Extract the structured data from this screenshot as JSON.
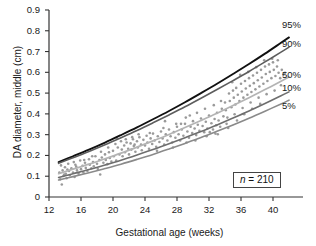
{
  "figure": {
    "background": "#ffffff",
    "axis_color": "#333333",
    "text_color": "#1a1a1a"
  },
  "axes": {
    "y_title": "DA diameter, middle (cm)",
    "x_title": "Gestational age (weeks)",
    "y_ticks": [
      "0.9",
      "0.8",
      "0.7",
      "0.6",
      "0.5",
      "0.4",
      "0.3",
      "0.2",
      "0.1",
      "0"
    ],
    "x_ticks": [
      "12",
      "16",
      "20",
      "24",
      "28",
      "32",
      "36",
      "40"
    ]
  },
  "annotation": {
    "n_symbol": "n",
    "n_equals": " = ",
    "n_value": "210"
  },
  "series_labels": {
    "p95": "95%",
    "p90": "90%",
    "p50": "50%",
    "p10": "10%",
    "p5": "5%"
  },
  "chart_data": {
    "type": "line",
    "title": "",
    "subtitle": "",
    "xlabel": "Gestational age (weeks)",
    "ylabel": "DA diameter, middle (cm)",
    "xlim": [
      12,
      42.2
    ],
    "ylim": [
      0,
      0.9
    ],
    "xticks": [
      12,
      16,
      20,
      24,
      28,
      32,
      36,
      40
    ],
    "yticks": [
      0,
      0.1,
      0.2,
      0.3,
      0.4,
      0.5,
      0.6,
      0.7,
      0.8,
      0.9
    ],
    "grid": false,
    "legend": "right-end-of-curves",
    "sample_size": 210,
    "annotations": [
      {
        "text": "n = 210",
        "x": 38.5,
        "y": 0.065,
        "boxed": true
      }
    ],
    "x": [
      13.2,
      15,
      17,
      19,
      21,
      23,
      25,
      27,
      29,
      31,
      33,
      35,
      37,
      39,
      41,
      42
    ],
    "series": [
      {
        "name": "95%",
        "color": "#111111",
        "width": 1.9,
        "values": [
          0.168,
          0.196,
          0.228,
          0.262,
          0.298,
          0.335,
          0.374,
          0.414,
          0.456,
          0.5,
          0.545,
          0.592,
          0.64,
          0.69,
          0.742,
          0.768
        ]
      },
      {
        "name": "90%",
        "color": "#5d5d5d",
        "width": 1.6,
        "values": [
          0.162,
          0.189,
          0.219,
          0.251,
          0.285,
          0.32,
          0.357,
          0.395,
          0.434,
          0.475,
          0.517,
          0.56,
          0.604,
          0.65,
          0.697,
          0.721
        ]
      },
      {
        "name": "50%",
        "color": "#b4b4b4",
        "width": 1.7,
        "values": [
          0.112,
          0.134,
          0.158,
          0.184,
          0.211,
          0.24,
          0.27,
          0.301,
          0.334,
          0.368,
          0.403,
          0.44,
          0.478,
          0.517,
          0.557,
          0.578
        ]
      },
      {
        "name": "10%",
        "color": "#6e6e6e",
        "width": 1.6,
        "values": [
          0.094,
          0.112,
          0.132,
          0.154,
          0.177,
          0.202,
          0.228,
          0.256,
          0.285,
          0.315,
          0.347,
          0.38,
          0.414,
          0.45,
          0.487,
          0.506
        ]
      },
      {
        "name": "5%",
        "color": "#8a8a8a",
        "width": 1.6,
        "values": [
          0.082,
          0.098,
          0.117,
          0.137,
          0.158,
          0.181,
          0.205,
          0.231,
          0.258,
          0.286,
          0.316,
          0.347,
          0.379,
          0.413,
          0.448,
          0.466
        ]
      }
    ],
    "scatter": {
      "name": "observations",
      "color": "#9a9a9a",
      "marker": "dot",
      "size": 1.3,
      "n": 210,
      "points": [
        [
          13.3,
          0.118
        ],
        [
          13.4,
          0.085
        ],
        [
          13.5,
          0.152
        ],
        [
          13.6,
          0.06
        ],
        [
          13.7,
          0.128
        ],
        [
          13.8,
          0.101
        ],
        [
          14.0,
          0.143
        ],
        [
          14.1,
          0.112
        ],
        [
          14.2,
          0.09
        ],
        [
          14.4,
          0.16
        ],
        [
          14.5,
          0.125
        ],
        [
          14.6,
          0.105
        ],
        [
          14.8,
          0.138
        ],
        [
          15.0,
          0.118
        ],
        [
          15.1,
          0.168
        ],
        [
          15.2,
          0.096
        ],
        [
          15.4,
          0.146
        ],
        [
          15.5,
          0.128
        ],
        [
          15.7,
          0.112
        ],
        [
          15.9,
          0.176
        ],
        [
          16.0,
          0.134
        ],
        [
          16.2,
          0.15
        ],
        [
          16.3,
          0.118
        ],
        [
          16.5,
          0.165
        ],
        [
          16.6,
          0.14
        ],
        [
          16.8,
          0.125
        ],
        [
          17.0,
          0.182
        ],
        [
          17.1,
          0.155
        ],
        [
          17.3,
          0.138
        ],
        [
          17.5,
          0.168
        ],
        [
          17.6,
          0.148
        ],
        [
          17.8,
          0.196
        ],
        [
          18.0,
          0.16
        ],
        [
          18.1,
          0.135
        ],
        [
          18.3,
          0.178
        ],
        [
          18.4,
          0.108
        ],
        [
          18.6,
          0.19
        ],
        [
          18.8,
          0.165
        ],
        [
          19.0,
          0.205
        ],
        [
          19.1,
          0.178
        ],
        [
          19.3,
          0.158
        ],
        [
          19.5,
          0.215
        ],
        [
          19.6,
          0.188
        ],
        [
          19.8,
          0.17
        ],
        [
          20.0,
          0.222
        ],
        [
          20.1,
          0.196
        ],
        [
          20.3,
          0.255
        ],
        [
          20.4,
          0.175
        ],
        [
          20.6,
          0.238
        ],
        [
          20.8,
          0.205
        ],
        [
          21.0,
          0.268
        ],
        [
          21.1,
          0.228
        ],
        [
          21.2,
          0.196
        ],
        [
          21.4,
          0.248
        ],
        [
          21.5,
          0.215
        ],
        [
          21.7,
          0.262
        ],
        [
          21.9,
          0.232
        ],
        [
          22.0,
          0.205
        ],
        [
          22.2,
          0.258
        ],
        [
          22.3,
          0.228
        ],
        [
          22.5,
          0.278
        ],
        [
          22.6,
          0.245
        ],
        [
          22.8,
          0.218
        ],
        [
          23.0,
          0.268
        ],
        [
          23.1,
          0.238
        ],
        [
          23.3,
          0.288
        ],
        [
          23.5,
          0.252
        ],
        [
          23.6,
          0.225
        ],
        [
          23.8,
          0.275
        ],
        [
          24.0,
          0.248
        ],
        [
          24.2,
          0.295
        ],
        [
          24.3,
          0.262
        ],
        [
          24.5,
          0.232
        ],
        [
          24.7,
          0.282
        ],
        [
          24.9,
          0.255
        ],
        [
          25.0,
          0.305
        ],
        [
          25.2,
          0.272
        ],
        [
          25.4,
          0.242
        ],
        [
          25.6,
          0.292
        ],
        [
          25.8,
          0.265
        ],
        [
          26.0,
          0.315
        ],
        [
          26.2,
          0.282
        ],
        [
          26.4,
          0.252
        ],
        [
          26.6,
          0.302
        ],
        [
          26.8,
          0.272
        ],
        [
          27.0,
          0.325
        ],
        [
          27.2,
          0.292
        ],
        [
          27.4,
          0.262
        ],
        [
          27.6,
          0.312
        ],
        [
          27.8,
          0.285
        ],
        [
          28.0,
          0.338
        ],
        [
          28.2,
          0.302
        ],
        [
          28.4,
          0.272
        ],
        [
          28.6,
          0.325
        ],
        [
          28.8,
          0.295
        ],
        [
          29.0,
          0.352
        ],
        [
          29.1,
          0.382
        ],
        [
          29.3,
          0.315
        ],
        [
          29.5,
          0.285
        ],
        [
          29.7,
          0.338
        ],
        [
          29.9,
          0.308
        ],
        [
          30.0,
          0.365
        ],
        [
          30.2,
          0.33
        ],
        [
          30.4,
          0.298
        ],
        [
          30.6,
          0.348
        ],
        [
          30.8,
          0.318
        ],
        [
          31.0,
          0.378
        ],
        [
          31.2,
          0.342
        ],
        [
          31.4,
          0.312
        ],
        [
          31.6,
          0.362
        ],
        [
          31.8,
          0.33
        ],
        [
          32.0,
          0.392
        ],
        [
          32.1,
          0.312
        ],
        [
          32.3,
          0.355
        ],
        [
          32.5,
          0.325
        ],
        [
          32.7,
          0.375
        ],
        [
          32.9,
          0.345
        ],
        [
          33.0,
          0.405
        ],
        [
          33.2,
          0.368
        ],
        [
          33.4,
          0.338
        ],
        [
          33.6,
          0.425
        ],
        [
          33.8,
          0.388
        ],
        [
          34.0,
          0.455
        ],
        [
          34.1,
          0.418
        ],
        [
          34.3,
          0.382
        ],
        [
          34.5,
          0.498
        ],
        [
          34.6,
          0.462
        ],
        [
          34.8,
          0.432
        ],
        [
          35.0,
          0.512
        ],
        [
          35.1,
          0.478
        ],
        [
          35.3,
          0.445
        ],
        [
          35.4,
          0.525
        ],
        [
          35.6,
          0.492
        ],
        [
          35.8,
          0.462
        ],
        [
          36.0,
          0.545
        ],
        [
          36.1,
          0.508
        ],
        [
          36.3,
          0.478
        ],
        [
          36.5,
          0.558
        ],
        [
          36.6,
          0.522
        ],
        [
          36.8,
          0.492
        ],
        [
          37.0,
          0.572
        ],
        [
          37.1,
          0.535
        ],
        [
          37.3,
          0.505
        ],
        [
          37.5,
          0.585
        ],
        [
          37.6,
          0.548
        ],
        [
          37.8,
          0.518
        ],
        [
          38.0,
          0.598
        ],
        [
          38.1,
          0.562
        ],
        [
          38.3,
          0.532
        ],
        [
          38.5,
          0.612
        ],
        [
          38.6,
          0.575
        ],
        [
          38.8,
          0.545
        ],
        [
          39.0,
          0.628
        ],
        [
          39.1,
          0.592
        ],
        [
          39.3,
          0.558
        ],
        [
          39.5,
          0.638
        ],
        [
          39.6,
          0.602
        ],
        [
          39.8,
          0.572
        ],
        [
          40.0,
          0.648
        ],
        [
          40.1,
          0.612
        ],
        [
          40.3,
          0.582
        ],
        [
          40.5,
          0.628
        ],
        [
          40.7,
          0.598
        ],
        [
          40.9,
          0.572
        ],
        [
          41.1,
          0.612
        ],
        [
          41.3,
          0.588
        ],
        [
          34.2,
          0.352
        ],
        [
          35.2,
          0.398
        ],
        [
          36.2,
          0.428
        ],
        [
          37.2,
          0.455
        ],
        [
          38.2,
          0.478
        ],
        [
          39.2,
          0.495
        ],
        [
          40.2,
          0.512
        ],
        [
          41.0,
          0.538
        ],
        [
          33.1,
          0.302
        ],
        [
          34.4,
          0.332
        ],
        [
          35.5,
          0.368
        ],
        [
          36.4,
          0.398
        ],
        [
          37.4,
          0.425
        ],
        [
          38.4,
          0.448
        ],
        [
          28.5,
          0.352
        ],
        [
          29.6,
          0.392
        ],
        [
          30.5,
          0.405
        ],
        [
          31.5,
          0.425
        ],
        [
          32.6,
          0.442
        ],
        [
          26.3,
          0.332
        ],
        [
          24.6,
          0.308
        ],
        [
          23.2,
          0.302
        ],
        [
          22.4,
          0.288
        ],
        [
          21.6,
          0.278
        ],
        [
          20.5,
          0.282
        ],
        [
          19.4,
          0.238
        ],
        [
          18.5,
          0.218
        ],
        [
          17.4,
          0.196
        ],
        [
          16.4,
          0.178
        ],
        [
          15.3,
          0.155
        ],
        [
          14.3,
          0.132
        ],
        [
          13.9,
          0.108
        ],
        [
          30.3,
          0.272
        ],
        [
          31.7,
          0.292
        ],
        [
          32.8,
          0.305
        ],
        [
          27.5,
          0.238
        ],
        [
          25.5,
          0.222
        ],
        [
          22.7,
          0.252
        ],
        [
          26.5,
          0.365
        ],
        [
          27.9,
          0.352
        ],
        [
          29.2,
          0.262
        ],
        [
          33.5,
          0.462
        ],
        [
          35.9,
          0.588
        ],
        [
          38.9,
          0.658
        ],
        [
          39.9,
          0.665
        ],
        [
          34.9,
          0.552
        ],
        [
          36.9,
          0.602
        ],
        [
          37.9,
          0.625
        ],
        [
          40.6,
          0.658
        ],
        [
          41.5,
          0.598
        ]
      ]
    }
  }
}
